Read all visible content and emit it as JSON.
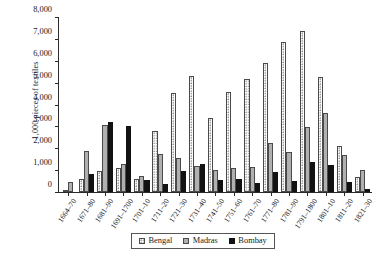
{
  "chart_data": {
    "type": "bar",
    "title": "",
    "xlabel": "",
    "ylabel": "1,000 pieces of textiles",
    "ylim": [
      0,
      8000
    ],
    "ytick_values": [
      0,
      1000,
      2000,
      3000,
      4000,
      5000,
      6000,
      7000,
      8000
    ],
    "ytick_labels": [
      "0",
      "1,000",
      "2,000",
      "3,000",
      "4,000",
      "5,000",
      "6,000",
      "7,000",
      "8,000"
    ],
    "grid": false,
    "legend_position": "bottom-center",
    "categories": [
      "1664–70",
      "1671–80",
      "1681–90",
      "1691–1700",
      "1701–10",
      "1711–20",
      "1721–30",
      "1731–40",
      "1741–50",
      "1751–60",
      "1761–70",
      "1771–80",
      "1781–90",
      "1791–1800",
      "1801–10",
      "1811–20",
      "1821–30"
    ],
    "series": [
      {
        "name": "Bengal",
        "color": "#ffffff",
        "pattern": "dotted",
        "values": [
          100,
          620,
          980,
          1100,
          620,
          2800,
          4550,
          5350,
          3400,
          4600,
          5200,
          5950,
          6900,
          7400,
          5300,
          2100,
          700
        ]
      },
      {
        "name": "Madras",
        "color": "#b0b0b0",
        "pattern": "solid-gray",
        "values": [
          460,
          1900,
          3060,
          1300,
          750,
          1750,
          1550,
          1200,
          1000,
          1100,
          1150,
          2250,
          1850,
          3000,
          3650,
          1700,
          1000
        ]
      },
      {
        "name": "Bombay",
        "color": "#121212",
        "pattern": "solid-black",
        "values": [
          0,
          850,
          3230,
          3050,
          550,
          380,
          950,
          1300,
          550,
          620,
          420,
          900,
          500,
          1400,
          1250,
          480,
          140
        ]
      }
    ]
  },
  "legend": {
    "items": [
      {
        "label": "Bengal"
      },
      {
        "label": "Madras"
      },
      {
        "label": "Bombay"
      }
    ]
  }
}
